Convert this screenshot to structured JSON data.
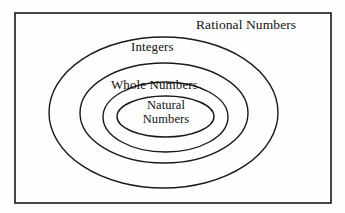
{
  "diagram": {
    "background_color": "#fefefe",
    "stroke_color": "#1a1a1a",
    "text_color": "#111111",
    "sets": {
      "rational": {
        "label": "Rational Numbers",
        "shape": "rectangle",
        "bounds": {
          "x": 15,
          "y": 13,
          "width": 316,
          "height": 190
        },
        "stroke_width": 1.6
      },
      "integers": {
        "label": "Integers",
        "shape": "ellipse",
        "center": {
          "cx": 163.5,
          "cy": 112.5
        },
        "radii": {
          "rx": 114.5,
          "ry": 75.5
        },
        "stroke_width": 1.4
      },
      "ring_second": {
        "label": "",
        "shape": "ellipse",
        "center": {
          "cx": 164,
          "cy": 113
        },
        "radii": {
          "rx": 84,
          "ry": 50
        },
        "stroke_width": 1.4
      },
      "whole": {
        "label": "Whole Numbers",
        "shape": "ellipse",
        "center": {
          "cx": 165.5,
          "cy": 117
        },
        "radii": {
          "rx": 62.5,
          "ry": 35
        },
        "stroke_width": 1.4
      },
      "natural": {
        "label_line1": "Natural",
        "label_line2": "Numbers",
        "shape": "ellipse",
        "center": {
          "cx": 165.5,
          "cy": 116.5
        },
        "radii": {
          "rx": 48.5,
          "ry": 20.5
        },
        "stroke_width": 1.4
      }
    }
  }
}
